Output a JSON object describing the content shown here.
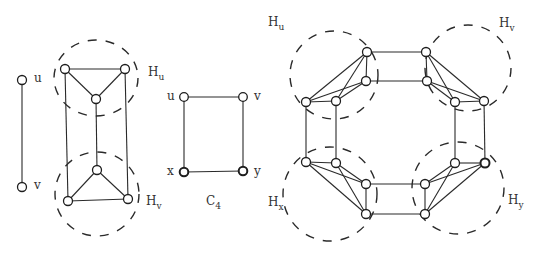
{
  "diagram": {
    "k2": {
      "labels": {
        "top": "u",
        "bottom": "v"
      },
      "vertices": [
        [
          22,
          80
        ],
        [
          22,
          187
        ]
      ]
    },
    "left_graph": {
      "hu": {
        "main": "H",
        "sub": "u"
      },
      "hv": {
        "main": "H",
        "sub": "v"
      },
      "vertices": [
        [
          65,
          69
        ],
        [
          125,
          69
        ],
        [
          96,
          99
        ],
        [
          97,
          170
        ],
        [
          68,
          201
        ],
        [
          128,
          199
        ]
      ]
    },
    "c4": {
      "labels": {
        "tl": "u",
        "tr": "v",
        "bl": "x",
        "br": "y"
      },
      "caption": {
        "main": "C",
        "sub": "4"
      },
      "vertices": [
        [
          184,
          97
        ],
        [
          243,
          97
        ],
        [
          184,
          172
        ],
        [
          243,
          171
        ]
      ]
    },
    "right_graph": {
      "hu": {
        "main": "H",
        "sub": "u"
      },
      "hv": {
        "main": "H",
        "sub": "v"
      },
      "hx": {
        "main": "H",
        "sub": "x"
      },
      "hy": {
        "main": "H",
        "sub": "y"
      }
    }
  }
}
